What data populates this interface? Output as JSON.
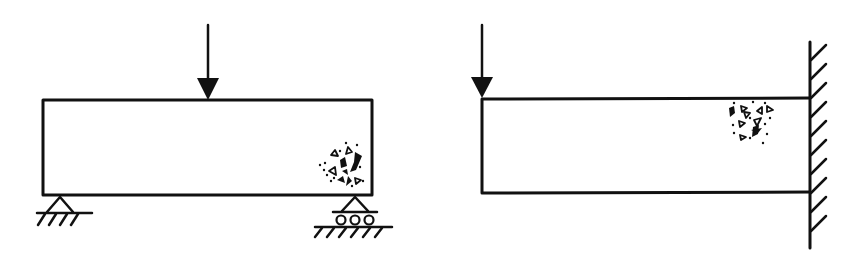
{
  "diagram": {
    "colors": {
      "line": "#111111",
      "background": "#ffffff"
    },
    "panels": [
      {
        "id": "simply-supported-beam",
        "type": "simply supported beam",
        "load": "point load at midspan (downward arrow)",
        "supports": [
          "pin support (left)",
          "roller support (right)"
        ],
        "damage_zone": "aggregate cluster near bottom-right, above roller support"
      },
      {
        "id": "cantilever-beam",
        "type": "cantilever beam",
        "load": "point load at free end (downward arrow)",
        "supports": [
          "fixed wall (right)"
        ],
        "damage_zone": "aggregate cluster near top-right, adjacent to fixed wall"
      }
    ]
  }
}
